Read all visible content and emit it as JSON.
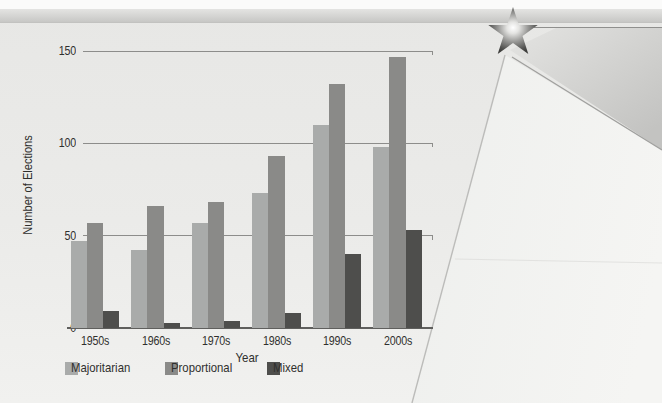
{
  "page": {
    "background_color": "#eaeae8",
    "top_band_color": "#cfcfcd",
    "star_icon": "star-with-radial-glow"
  },
  "chart_data": {
    "type": "bar",
    "title": "",
    "xlabel": "Year",
    "ylabel": "Number of Elections",
    "categories": [
      "1950s",
      "1960s",
      "1970s",
      "1980s",
      "1990s",
      "2000s"
    ],
    "series": [
      {
        "name": "Majoritarian",
        "color": "#a9abaa",
        "values": [
          47,
          42,
          57,
          73,
          110,
          98
        ]
      },
      {
        "name": "Proportional",
        "color": "#8a8a88",
        "values": [
          57,
          66,
          68,
          93,
          132,
          147
        ]
      },
      {
        "name": "Mixed",
        "color": "#4e4e4c",
        "values": [
          9,
          3,
          4,
          8,
          40,
          53
        ]
      }
    ],
    "y_ticks": [
      0,
      50,
      100,
      150
    ],
    "ylim": [
      0,
      160
    ],
    "grid": true,
    "legend_position": "bottom",
    "gridline_color": "#8d8d8b",
    "axis_color": "#5f5f5d",
    "text_color": "#2f2f2d"
  }
}
